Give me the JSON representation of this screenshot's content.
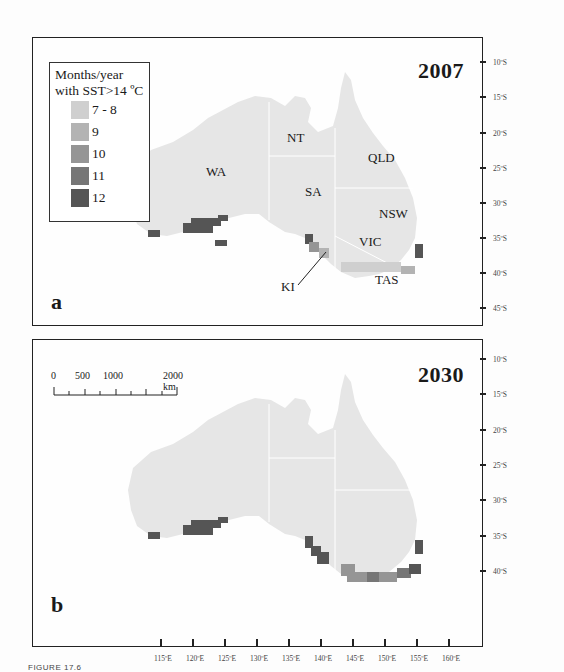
{
  "figure": {
    "caption": "FIGURE 17.6"
  },
  "legend": {
    "title_line1": "Months/year",
    "title_line2": "with SST>14 ºC",
    "items": [
      {
        "label": "7 - 8",
        "color": "#cfcfcf"
      },
      {
        "label": "9",
        "color": "#b3b3b3"
      },
      {
        "label": "10",
        "color": "#959595"
      },
      {
        "label": "11",
        "color": "#767676"
      },
      {
        "label": "12",
        "color": "#555555"
      }
    ]
  },
  "panel_a": {
    "letter": "a",
    "year": "2007",
    "state_labels": {
      "wa": "WA",
      "nt": "NT",
      "qld": "QLD",
      "sa": "SA",
      "nsw": "NSW",
      "vic": "VIC",
      "tas": "TAS",
      "ki": "KI"
    }
  },
  "panel_b": {
    "letter": "b",
    "year": "2030",
    "scale_bar": {
      "labels": [
        "0",
        "500",
        "1000",
        "2000 km"
      ]
    }
  },
  "axes": {
    "latitude_a": [
      "10ºS",
      "15ºS",
      "20ºS",
      "25ºS",
      "30ºS",
      "35ºS",
      "40ºS",
      "45ºS"
    ],
    "latitude_b": [
      "10ºS",
      "15ºS",
      "20ºS",
      "25ºS",
      "30ºS",
      "35ºS",
      "40ºS"
    ],
    "longitude": [
      "115ºE",
      "120ºE",
      "125ºE",
      "130ºE",
      "135ºE",
      "140ºE",
      "145ºE",
      "150ºE",
      "155ºE",
      "160ºE"
    ]
  },
  "colors": {
    "land": "#e9e9e9",
    "border": "#ffffff",
    "frame": "#222222"
  }
}
